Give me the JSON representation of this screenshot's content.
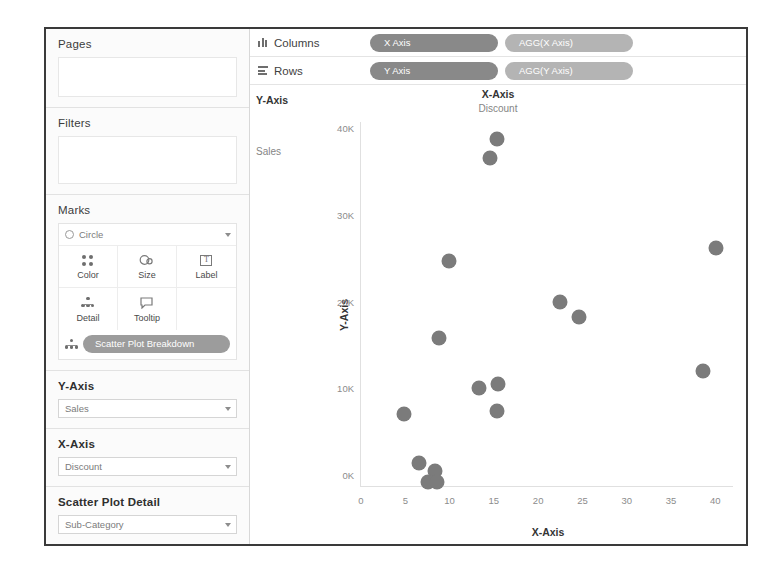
{
  "left_panel": {
    "pages": {
      "title": "Pages"
    },
    "filters": {
      "title": "Filters"
    },
    "marks": {
      "title": "Marks",
      "mark_type": "Circle",
      "mark_type_icon": "circle-icon",
      "buttons": [
        {
          "label": "Color",
          "icon": "color-icon"
        },
        {
          "label": "Size",
          "icon": "size-icon"
        },
        {
          "label": "Label",
          "icon": "label-icon"
        },
        {
          "label": "Detail",
          "icon": "detail-icon"
        },
        {
          "label": "Tooltip",
          "icon": "tooltip-icon"
        }
      ],
      "detail_pill": {
        "label": "Scatter Plot Breakdown",
        "icon": "detail-icon"
      }
    },
    "parameters": [
      {
        "title": "Y-Axis",
        "value": "Sales"
      },
      {
        "title": "X-Axis",
        "value": "Discount"
      },
      {
        "title": "Scatter Plot Detail",
        "value": "Sub-Category"
      }
    ]
  },
  "shelves": [
    {
      "name": "Columns",
      "icon": "columns-icon",
      "pills": [
        {
          "label": "X Axis",
          "kind": "blue"
        },
        {
          "label": "AGG(X Axis)",
          "kind": "green"
        }
      ]
    },
    {
      "name": "Rows",
      "icon": "rows-icon",
      "pills": [
        {
          "label": "Y Axis",
          "kind": "blue"
        },
        {
          "label": "AGG(Y Axis)",
          "kind": "green"
        }
      ]
    }
  ],
  "viz": {
    "row_caption": "Y-Axis",
    "row_header": "Sales",
    "col_caption": "X-Axis",
    "col_header": "Discount",
    "colors": {
      "mark": "#7b7b7b",
      "pill_blue": "#898989",
      "pill_green": "#b4b4b4"
    }
  },
  "chart_data": {
    "type": "scatter",
    "title": "X-Axis",
    "subtitle": "Discount",
    "xlabel": "X-Axis",
    "ylabel": "Y-Axis",
    "xlim": [
      0,
      42
    ],
    "ylim": [
      0,
      42000
    ],
    "grid": false,
    "legend": null,
    "xticks": [
      0,
      5,
      10,
      15,
      20,
      25,
      30,
      35,
      40
    ],
    "xticklabels": [
      "0",
      "5",
      "10",
      "15",
      "20",
      "25",
      "30",
      "35",
      "40"
    ],
    "yticks": [
      0,
      10000,
      20000,
      30000,
      40000
    ],
    "yticklabels": [
      "0K",
      "10K",
      "20K",
      "30K",
      "40K"
    ],
    "series": [
      {
        "name": "Sub-Category",
        "marker": "circle",
        "color": "#7b7b7b",
        "points": [
          {
            "x": 15.3,
            "y": 40000
          },
          {
            "x": 14.6,
            "y": 37800
          },
          {
            "x": 40.1,
            "y": 27500
          },
          {
            "x": 9.9,
            "y": 26000
          },
          {
            "x": 22.5,
            "y": 21200
          },
          {
            "x": 24.6,
            "y": 19500
          },
          {
            "x": 8.8,
            "y": 17100
          },
          {
            "x": 38.6,
            "y": 13300
          },
          {
            "x": 13.3,
            "y": 11300
          },
          {
            "x": 15.5,
            "y": 11800
          },
          {
            "x": 15.4,
            "y": 8700
          },
          {
            "x": 4.8,
            "y": 8300
          },
          {
            "x": 6.5,
            "y": 2600
          },
          {
            "x": 8.3,
            "y": 1700
          },
          {
            "x": 7.6,
            "y": 500
          },
          {
            "x": 8.6,
            "y": 450
          }
        ]
      }
    ]
  }
}
